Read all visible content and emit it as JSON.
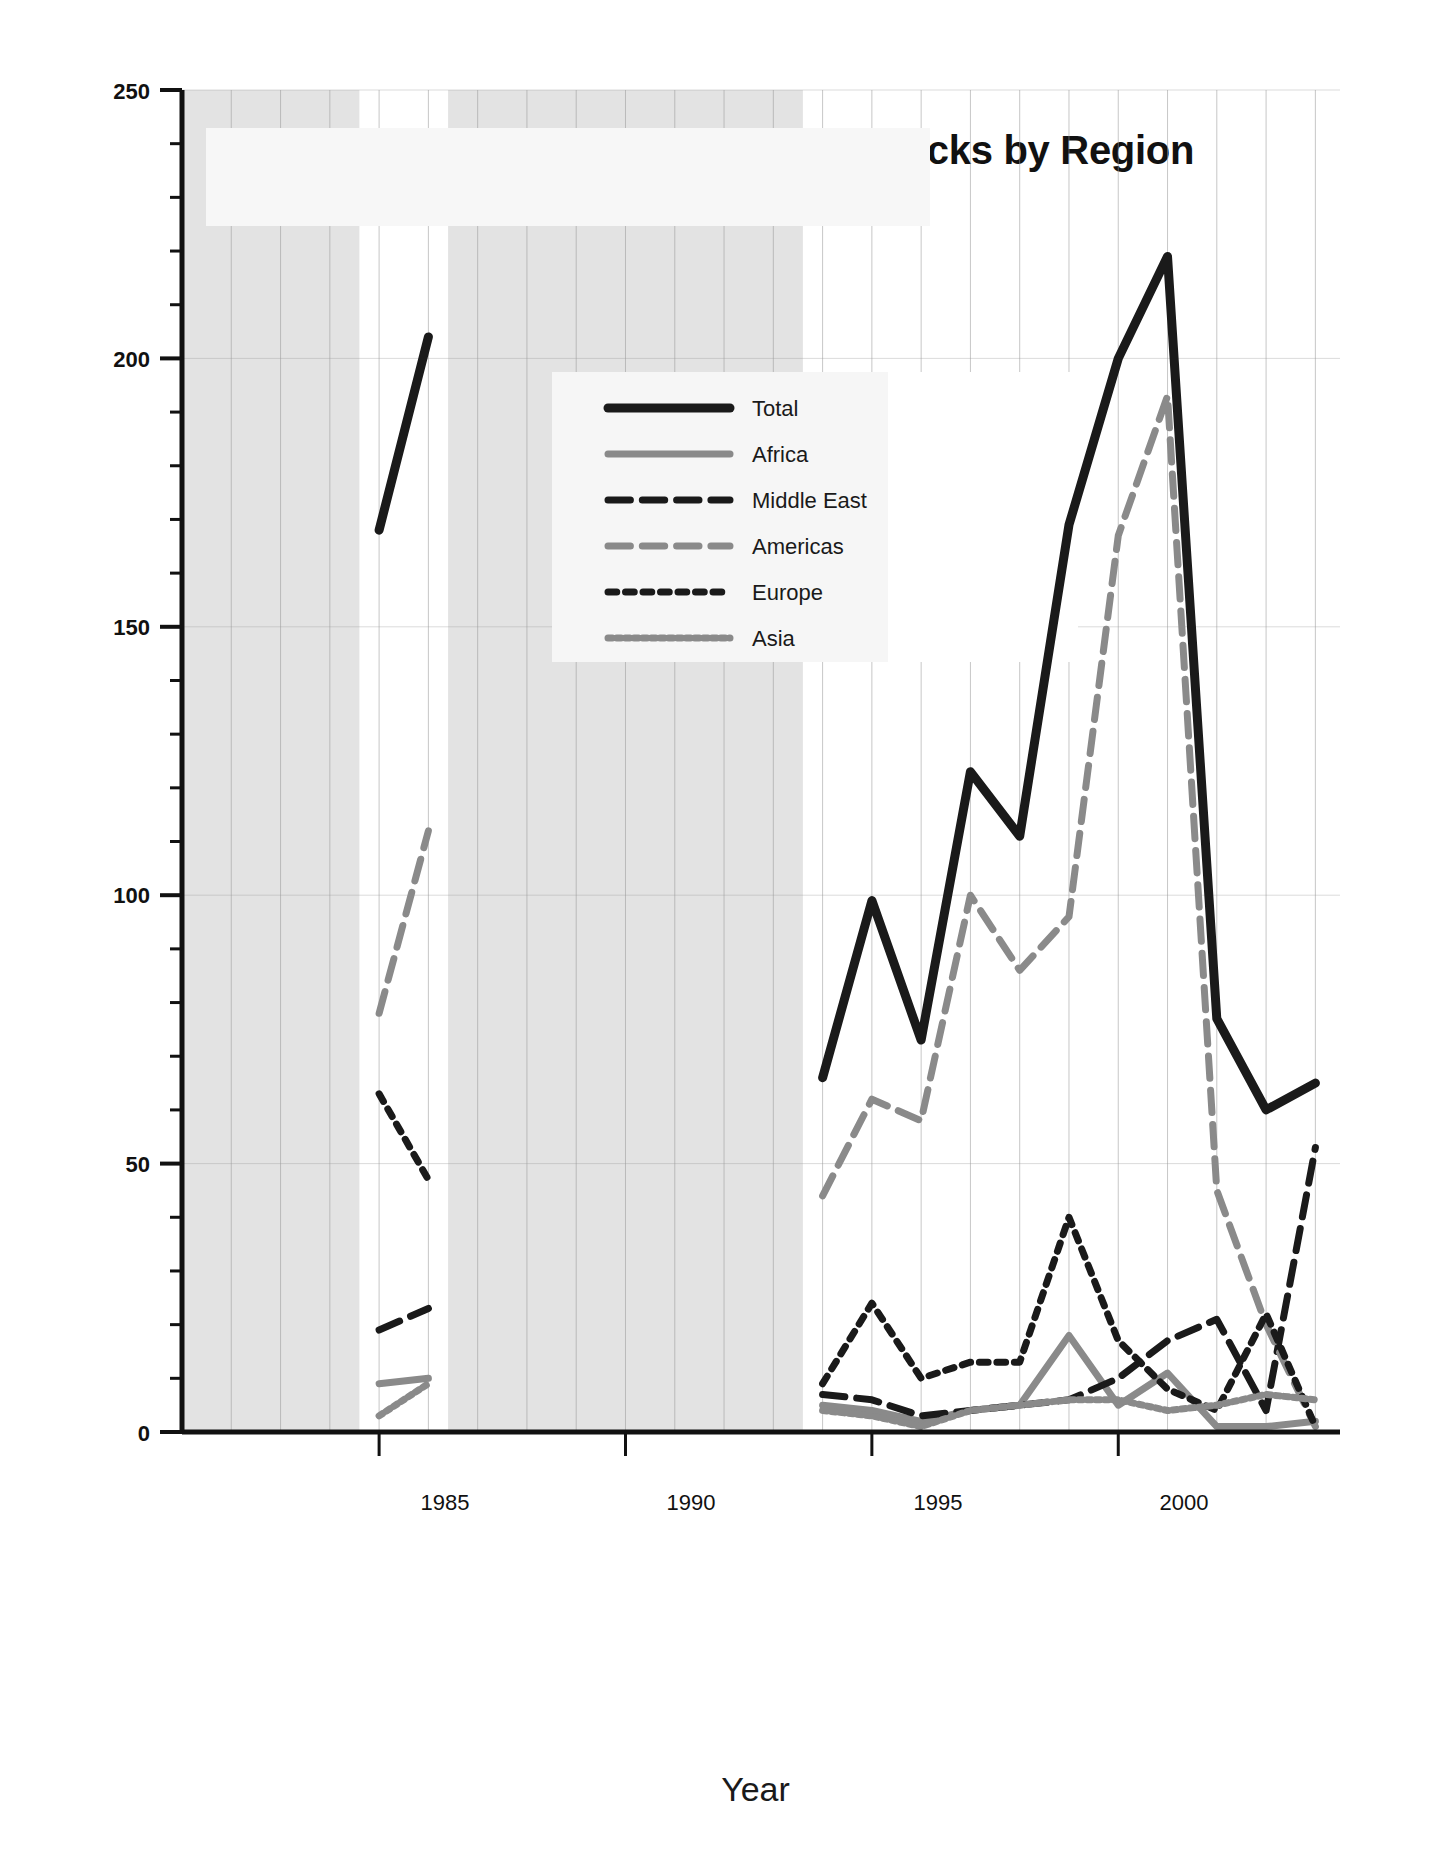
{
  "chart_data": {
    "type": "line",
    "title": "Anti-United States Terrorist Attacks by Region",
    "subtitle": "1981 to 2004",
    "xlabel": "Year",
    "ylabel": "Number of Anti-US Attacks",
    "xlim": [
      1981,
      2004.5
    ],
    "ylim": [
      0,
      250
    ],
    "yticks": [
      0,
      50,
      100,
      150,
      200,
      250
    ],
    "xticks": [
      1985,
      1990,
      1995,
      2000
    ],
    "grid": true,
    "legend_position": "upper-center",
    "annotations": [
      {
        "text": "NO DATA",
        "x_range": [
          1981,
          1984.6
        ]
      },
      {
        "text": "NO DATA",
        "x_range": [
          1986.4,
          1993.6
        ]
      }
    ],
    "series": [
      {
        "name": "Total",
        "style": "solid",
        "color": "#1a1a1a",
        "width": 9,
        "segments": [
          {
            "x": [
              1985,
              1986
            ],
            "y": [
              168,
              204
            ]
          },
          {
            "x": [
              1994,
              1995,
              1996,
              1997,
              1998,
              1999,
              2000,
              2001,
              2002,
              2003,
              2004
            ],
            "y": [
              66,
              99,
              73,
              123,
              111,
              169,
              200,
              219,
              77,
              60,
              65
            ]
          }
        ]
      },
      {
        "name": "Africa",
        "style": "solid",
        "color": "#8a8a8a",
        "width": 7,
        "segments": [
          {
            "x": [
              1985,
              1986
            ],
            "y": [
              9,
              10
            ]
          },
          {
            "x": [
              1994,
              1995,
              1996,
              1997,
              1998,
              1999,
              2000,
              2001,
              2002,
              2003,
              2004
            ],
            "y": [
              5,
              4,
              2,
              4,
              5,
              18,
              5,
              11,
              1,
              1,
              2
            ]
          }
        ]
      },
      {
        "name": "Middle East",
        "style": "dash-long",
        "color": "#1a1a1a",
        "width": 7,
        "segments": [
          {
            "x": [
              1985,
              1986
            ],
            "y": [
              19,
              23
            ]
          },
          {
            "x": [
              1994,
              1995,
              1996,
              1997,
              1998,
              1999,
              2000,
              2001,
              2002,
              2003,
              2004
            ],
            "y": [
              7,
              6,
              3,
              4,
              5,
              6,
              10,
              17,
              21,
              4,
              53
            ]
          }
        ]
      },
      {
        "name": "Americas",
        "style": "dash-long",
        "color": "#8a8a8a",
        "width": 7,
        "segments": [
          {
            "x": [
              1985,
              1986
            ],
            "y": [
              78,
              112
            ]
          },
          {
            "x": [
              1994,
              1995,
              1996,
              1997,
              1998,
              1999,
              2000,
              2001,
              2002,
              2003,
              2004
            ],
            "y": [
              44,
              62,
              58,
              100,
              86,
              96,
              167,
              193,
              45,
              20,
              1
            ]
          }
        ]
      },
      {
        "name": "Europe",
        "style": "dot-dash",
        "color": "#1a1a1a",
        "width": 7,
        "segments": [
          {
            "x": [
              1985,
              1986
            ],
            "y": [
              63,
              47
            ]
          },
          {
            "x": [
              1994,
              1995,
              1996,
              1997,
              1998,
              1999,
              2000,
              2001,
              2002,
              2003,
              2004
            ],
            "y": [
              9,
              24,
              10,
              13,
              13,
              40,
              17,
              8,
              4,
              22,
              1
            ]
          }
        ]
      },
      {
        "name": "Asia",
        "style": "dot-fine",
        "color": "#8a8a8a",
        "width": 7,
        "segments": [
          {
            "x": [
              1985,
              1986
            ],
            "y": [
              3,
              9
            ]
          },
          {
            "x": [
              1994,
              1995,
              1996,
              1997,
              1998,
              1999,
              2000,
              2001,
              2002,
              2003,
              2004
            ],
            "y": [
              4,
              3,
              1,
              4,
              5,
              6,
              6,
              4,
              5,
              7,
              6
            ]
          }
        ]
      }
    ]
  },
  "title": {
    "main": "Anti-United States Terrorist Attacks by Region",
    "sub": "1981 to 2004"
  },
  "axes": {
    "ylabel": "Number of Anti-US Attacks",
    "xlabel": "Year",
    "yticks": [
      "250",
      "200",
      "150",
      "100",
      "50",
      "0"
    ],
    "xticks": [
      "1985",
      "1990",
      "1995",
      "2000"
    ]
  },
  "legend": {
    "items": [
      {
        "label": "Total"
      },
      {
        "label": "Africa"
      },
      {
        "label": "Middle East"
      },
      {
        "label": "Americas"
      },
      {
        "label": "Europe"
      },
      {
        "label": "Asia"
      }
    ]
  },
  "nodata": {
    "left": "NO DATA",
    "right": "NO DATA"
  },
  "colors": {
    "dark": "#1a1a1a",
    "gray": "#8a8a8a",
    "band": "#e3e3e3",
    "grid": "#9a9a9a"
  }
}
